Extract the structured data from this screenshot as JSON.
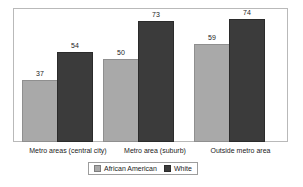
{
  "chart_data": {
    "type": "bar",
    "title": "",
    "subtitle": "",
    "xlabel": "",
    "ylabel": "",
    "ylim": [
      0,
      80
    ],
    "grid": false,
    "legend_position": "bottom",
    "categories": [
      "Metro areas (central city)",
      "Metro area (suburb)",
      "Outside metro area"
    ],
    "series": [
      {
        "name": "African American",
        "color": "#a9a9a9",
        "values": [
          37,
          50,
          59
        ]
      },
      {
        "name": "White",
        "color": "#3b3b3b",
        "values": [
          54,
          73,
          74
        ]
      }
    ],
    "value_labels": [
      [
        "37",
        "54"
      ],
      [
        "50",
        "73"
      ],
      [
        "59",
        "74"
      ]
    ]
  },
  "legend": {
    "items": [
      {
        "label": "African American",
        "swatch": "legend-swatch-african-american"
      },
      {
        "label": "White",
        "swatch": "legend-swatch-white"
      }
    ]
  },
  "colors": {
    "series_african_american": "#a9a9a9",
    "series_white": "#3b3b3b",
    "frame_border": "#b9b9b9",
    "legend_border": "#9d9d9d",
    "text": "#1b1b1b",
    "background": "#ffffff"
  }
}
